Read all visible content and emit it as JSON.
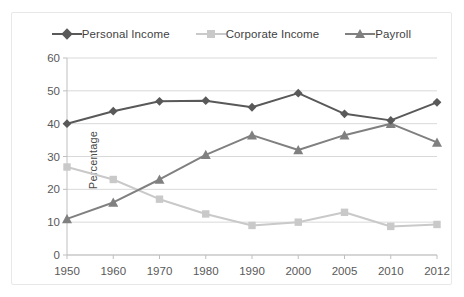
{
  "chart_data": {
    "type": "line",
    "title": "",
    "xlabel": "",
    "ylabel": "Percentage",
    "categories": [
      "1950",
      "1960",
      "1970",
      "1980",
      "1990",
      "2000",
      "2005",
      "2010",
      "2012"
    ],
    "ylim": [
      0,
      60
    ],
    "yticks": [
      "0",
      "10",
      "20",
      "30",
      "40",
      "50",
      "60"
    ],
    "grid": true,
    "legend_position": "top-center",
    "series": [
      {
        "name": "Personal Income",
        "marker": "diamond",
        "color": "#595959",
        "values": [
          40,
          43.8,
          46.8,
          47,
          45,
          49.3,
          43,
          41,
          46.5
        ]
      },
      {
        "name": "Corporate Income",
        "marker": "square",
        "color": "#c9c9c9",
        "values": [
          26.8,
          23,
          17,
          12.5,
          9,
          10,
          13,
          8.7,
          9.3
        ]
      },
      {
        "name": "Payroll",
        "marker": "triangle",
        "color": "#808080",
        "values": [
          11,
          16,
          23,
          30.5,
          36.5,
          32,
          36.5,
          40,
          34.3
        ]
      }
    ]
  },
  "colors": {
    "personal_income": "#595959",
    "corporate_income": "#c9c9c9",
    "payroll": "#808080",
    "grid": "#d9d9d9",
    "axis": "#bfbfbf",
    "frame": "#e8e8e8",
    "text": "#595959"
  }
}
